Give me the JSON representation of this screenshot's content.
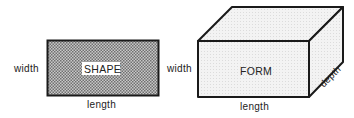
{
  "shape": {
    "title": "SHAPE",
    "width_label": "width",
    "length_label": "length"
  },
  "form": {
    "title": "FORM",
    "width_label": "width",
    "length_label": "length",
    "depth_label": "depth"
  },
  "colors": {
    "stroke": "#1a1a1a",
    "shape_fill": "#9a9a9a",
    "form_fill": "#ececec"
  }
}
